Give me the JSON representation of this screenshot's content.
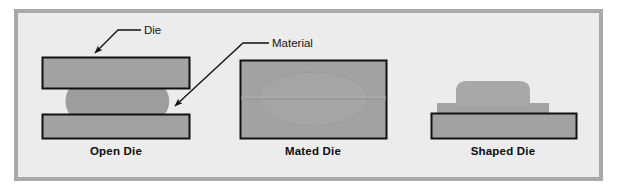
{
  "figure": {
    "panel_bg": "#ececec",
    "frame_color": "#a9a9a9",
    "die_fill": "#a0a0a0",
    "material_fill": "#9a9a9a",
    "outline_color": "#111111"
  },
  "callouts": [
    {
      "id": "die",
      "label": "Die",
      "points_to": "upper-die-block"
    },
    {
      "id": "material",
      "label": "Material",
      "points_to": "material-blob"
    }
  ],
  "stages": [
    {
      "id": "open-die",
      "caption": "Open Die",
      "description": "Upper and lower die blocks separated with material billet between them"
    },
    {
      "id": "mated-die",
      "caption": "Mated Die",
      "description": "Die halves closed, material filling the cavity with flash at the parting line"
    },
    {
      "id": "shaped-die",
      "caption": "Shaped Die",
      "description": "Formed part with shaped profile resting on the lower die block"
    }
  ]
}
